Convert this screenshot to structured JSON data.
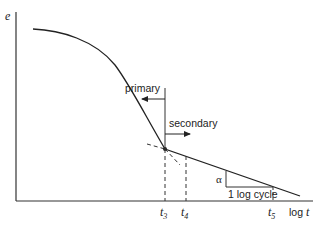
{
  "diagram": {
    "y_axis_label": "e",
    "x_axis_label_prefix": "log",
    "x_axis_label_var": "t",
    "regions": {
      "primary_label": "primary",
      "secondary_label": "secondary"
    },
    "ticks": [
      {
        "var": "t",
        "sub": "3"
      },
      {
        "var": "t",
        "sub": "4"
      },
      {
        "var": "t",
        "sub": "5"
      }
    ],
    "slope_symbol": "α",
    "slope_run_label": "1 log cycle",
    "colors": {
      "line": "#222222",
      "background": "#ffffff"
    }
  }
}
